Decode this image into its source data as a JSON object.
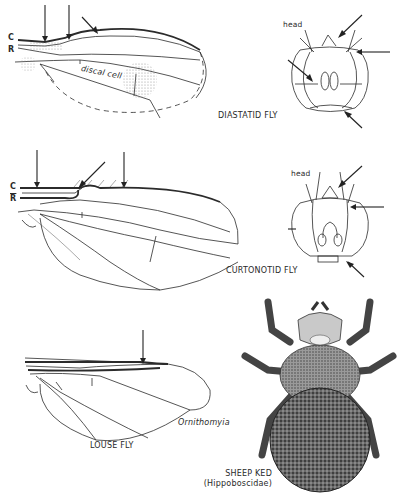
{
  "figures": [
    {
      "id": "diastatid",
      "title": "DIASTATID FLY",
      "wing_labels": {
        "costa": "C",
        "radius": "R",
        "cell": "discal cell"
      },
      "head_label": "head"
    },
    {
      "id": "curtonotid",
      "title": "CURTONOTID FLY",
      "wing_labels": {
        "costa": "C",
        "radius": "R"
      },
      "head_label": "head"
    },
    {
      "id": "louse",
      "title": "LOUSE FLY",
      "genus": "Ornithomyia"
    },
    {
      "id": "sheep-ked",
      "title": "SHEEP KED",
      "family": "(Hippoboscidae)"
    }
  ],
  "colors": {
    "ink": "#2b2b2b",
    "background": "#ffffff",
    "stipple": "#9a9a9a"
  }
}
